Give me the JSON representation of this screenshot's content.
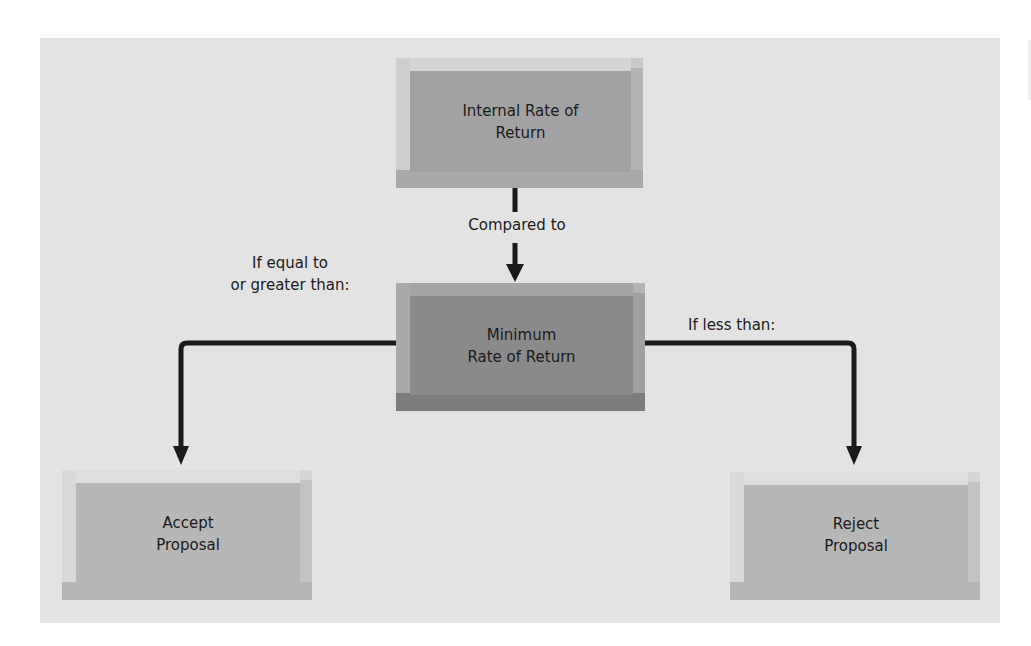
{
  "diagram": {
    "nodes": {
      "internal_rate": {
        "line1": "Internal Rate of",
        "line2": "Return"
      },
      "minimum_rate": {
        "line1": "Minimum",
        "line2": "Rate of Return"
      },
      "accept": {
        "line1": "Accept",
        "line2": "Proposal"
      },
      "reject": {
        "line1": "Reject",
        "line2": "Proposal"
      }
    },
    "edges": {
      "compared": {
        "label": "Compared to"
      },
      "greater_equal": {
        "line1": "If equal to",
        "line2": "or greater than:"
      },
      "less_than": {
        "label": "If less than:"
      }
    },
    "colors": {
      "background": "#e3e3e3",
      "internal_rate_fill": "#a2a2a2",
      "minimum_rate_fill": "#8a8a8a",
      "outcome_fill": "#b7b7b7",
      "arrow": "#1a1a1a"
    }
  }
}
